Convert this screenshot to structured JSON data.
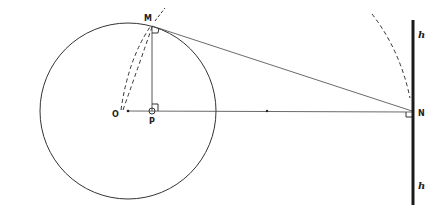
{
  "diagram": {
    "labels": {
      "O": "O",
      "M": "M",
      "P": "P",
      "N": "N",
      "h_top": "h",
      "h_bottom": "h"
    },
    "colors": {
      "stroke": "#333333",
      "thick_line": "#1a1a1a",
      "background": "#ffffff"
    },
    "points": {
      "O": [
        128,
        111
      ],
      "M": [
        152,
        26
      ],
      "P": [
        152,
        111
      ],
      "N": [
        412,
        112
      ]
    },
    "circle": {
      "center": [
        128,
        111
      ],
      "radius": 88
    }
  }
}
